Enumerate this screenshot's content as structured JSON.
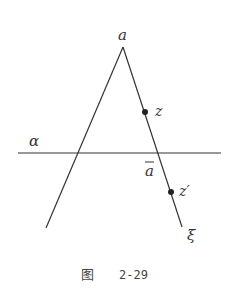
{
  "figure": {
    "caption_prefix": "图",
    "caption_number": "2-29",
    "line_color": "#333333",
    "points": {
      "apex": {
        "label": "a",
        "x": 123,
        "y": 47
      },
      "z": {
        "label": "z",
        "x": 145,
        "y": 112
      },
      "a_bar": {
        "label": "a",
        "x": 157,
        "y": 153
      },
      "z_prime": {
        "label": "z'",
        "x": 171,
        "y": 192
      }
    },
    "labels": {
      "apex": "a",
      "z": "z",
      "plane": "α",
      "a_bar": "a",
      "z_prime": "z′",
      "xi": "ξ"
    },
    "lines": [
      {
        "name": "plane-alpha",
        "x1": 18,
        "y1": 153,
        "x2": 221,
        "y2": 153
      },
      {
        "name": "left-ray",
        "x1": 123,
        "y1": 47,
        "x2": 46,
        "y2": 228
      },
      {
        "name": "xi-ray",
        "x1": 123,
        "y1": 47,
        "x2": 182,
        "y2": 227
      }
    ]
  }
}
